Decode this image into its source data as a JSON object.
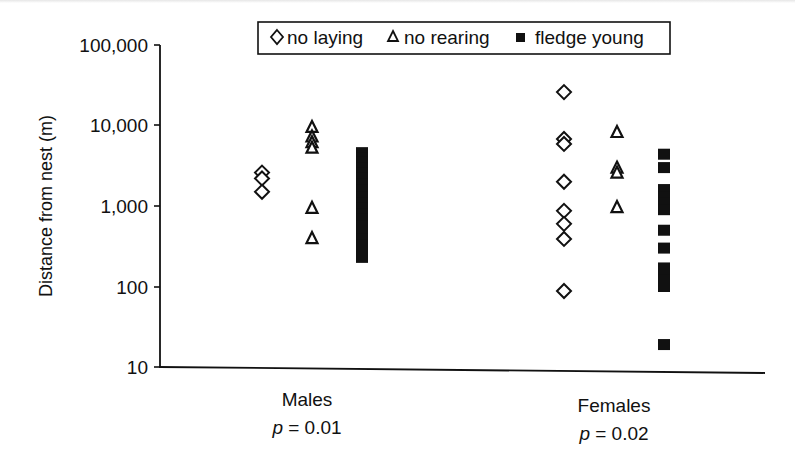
{
  "chart_data": {
    "type": "scatter",
    "title": "",
    "xlabel": "",
    "ylabel": "Distance from nest (m)",
    "yscale": "log",
    "ylim": [
      10,
      100000
    ],
    "yticks": [
      10,
      100,
      1000,
      10000,
      100000
    ],
    "ytick_labels": [
      "10",
      "100",
      "1,000",
      "10,000",
      "100,000"
    ],
    "grid": false,
    "legend_position": "top-center (boxed)",
    "categories": [
      "Males",
      "Females"
    ],
    "category_annotations": [
      "p = 0.01",
      "p = 0.02"
    ],
    "series": [
      {
        "name": "no laying",
        "marker": "open-diamond",
        "values": {
          "Males": [
            2600,
            2200,
            1500
          ],
          "Females": [
            26000,
            6800,
            5900,
            2000,
            870,
            600,
            390,
            88
          ]
        }
      },
      {
        "name": "no rearing",
        "marker": "open-triangle",
        "values": {
          "Males": [
            9600,
            7300,
            6200,
            5300,
            950,
            400
          ],
          "Females": [
            8300,
            3000,
            2600,
            970
          ]
        }
      },
      {
        "name": "fledge young",
        "marker": "filled-square",
        "values": {
          "Males": [
            4600,
            4000,
            3500,
            3000,
            2600,
            2200,
            1900,
            1600,
            1300,
            1100,
            950,
            800,
            680,
            560,
            460,
            390,
            330,
            280,
            230
          ],
          "Females": [
            4400,
            3000,
            1600,
            1300,
            1100,
            900,
            500,
            300,
            170,
            140,
            120,
            100,
            19
          ]
        },
        "note": "Males fledge-young points overlap into a continuous bar from ~230 to ~4,600 m"
      }
    ]
  },
  "axis": {
    "ylabel": "Distance from nest (m)",
    "ticks": [
      "100,000",
      "10,000",
      "1,000",
      "100",
      "10"
    ]
  },
  "legend": {
    "items": [
      {
        "label": "no laying",
        "marker": "diamond-open-icon"
      },
      {
        "label": "no rearing",
        "marker": "triangle-open-icon"
      },
      {
        "label": "fledge young",
        "marker": "square-filled-icon"
      }
    ]
  },
  "groups": [
    {
      "label": "Males",
      "p_prefix": "p",
      "p_rest": " = 0.01"
    },
    {
      "label": "Females",
      "p_prefix": "p",
      "p_rest": " = 0.02"
    }
  ],
  "colors": {
    "ink": "#111111",
    "background": "#ffffff"
  }
}
